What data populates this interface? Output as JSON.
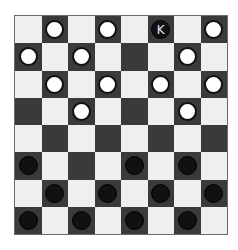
{
  "game": "checkers",
  "board": {
    "size": 8,
    "colors": {
      "light": "#efefef",
      "dark": "#3a3a3a",
      "white_piece": "#ffffff",
      "black_piece": "#111111"
    },
    "rows": [
      [
        "",
        "w",
        "",
        "w",
        "",
        "bK",
        "",
        "w"
      ],
      [
        "w",
        "",
        "w",
        "",
        "",
        "",
        "w",
        ""
      ],
      [
        "",
        "w",
        "",
        "w",
        "",
        "w",
        "",
        "w"
      ],
      [
        "",
        "",
        "w",
        "",
        "",
        "",
        "w",
        ""
      ],
      [
        "",
        "",
        "",
        "",
        "",
        "",
        "",
        ""
      ],
      [
        "b",
        "",
        "",
        "",
        "b",
        "",
        "b",
        ""
      ],
      [
        "",
        "b",
        "",
        "b",
        "",
        "b",
        "",
        "b"
      ],
      [
        "b",
        "",
        "b",
        "",
        "b",
        "",
        "b",
        ""
      ]
    ]
  },
  "labels": {
    "king": "K"
  }
}
